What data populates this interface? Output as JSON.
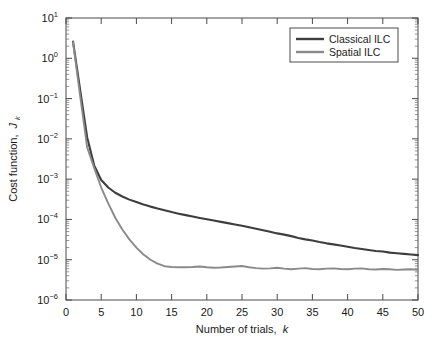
{
  "chart_data": {
    "type": "line",
    "title": "",
    "xlabel": "Number of trials, k",
    "ylabel": "Cost function, J_k",
    "xlabel_text": "Number of trials,",
    "xlabel_italic": "k",
    "ylabel_text": "Cost function,",
    "ylabel_italic": "J",
    "ylabel_sub": "k",
    "xlim": [
      0,
      50
    ],
    "ylim": [
      1e-06,
      10
    ],
    "yscale": "log",
    "xscale": "linear",
    "grid": false,
    "legend_position": "top-right",
    "xticks": [
      0,
      5,
      10,
      15,
      20,
      25,
      30,
      35,
      40,
      45,
      50
    ],
    "xticklabels": [
      "0",
      "5",
      "10",
      "15",
      "20",
      "25",
      "30",
      "35",
      "40",
      "45",
      "50"
    ],
    "yticks": [
      1e-06,
      1e-05,
      0.0001,
      0.001,
      0.01,
      0.1,
      1,
      10
    ],
    "yticklabels": [
      "10−6",
      "10−5",
      "10−4",
      "10−3",
      "10−2",
      "10−1",
      "10⁰",
      "10¹"
    ],
    "ytick_mantissa": "10",
    "ytick_exponents": [
      "-6",
      "-5",
      "-4",
      "-3",
      "-2",
      "-1",
      "0",
      "1"
    ],
    "colors": {
      "classical": "#3d3d3d",
      "spatial": "#8a8a8a",
      "axis": "#4a4a4a",
      "text": "#1a1a1a",
      "background": "#ffffff"
    },
    "x": [
      1,
      2,
      3,
      4,
      5,
      6,
      7,
      8,
      9,
      10,
      11,
      12,
      13,
      14,
      15,
      16,
      17,
      18,
      19,
      20,
      21,
      22,
      23,
      24,
      25,
      26,
      27,
      28,
      29,
      30,
      31,
      32,
      33,
      34,
      35,
      36,
      37,
      38,
      39,
      40,
      41,
      42,
      43,
      44,
      45,
      46,
      47,
      48,
      49,
      50
    ],
    "series": [
      {
        "name": "Classical ILC",
        "color": "#3d3d3d",
        "width": 2.1,
        "values": [
          2.6,
          0.17,
          0.011,
          0.0022,
          0.00095,
          0.00062,
          0.00046,
          0.00037,
          0.00031,
          0.00027,
          0.000235,
          0.000208,
          0.000186,
          0.000168,
          0.000152,
          0.000139,
          0.000128,
          0.000118,
          0.000109,
          0.000101,
          9.4e-05,
          8.7e-05,
          8.1e-05,
          7.5e-05,
          6.95e-05,
          6.4e-05,
          5.9e-05,
          5.4e-05,
          4.95e-05,
          4.5e-05,
          4.2e-05,
          3.85e-05,
          3.45e-05,
          3.2e-05,
          3e-05,
          2.75e-05,
          2.55e-05,
          2.4e-05,
          2.25e-05,
          2.1e-05,
          1.95e-05,
          1.85e-05,
          1.75e-05,
          1.65e-05,
          1.6e-05,
          1.5e-05,
          1.45e-05,
          1.4e-05,
          1.35e-05,
          1.3e-05
        ]
      },
      {
        "name": "Spatial ILC",
        "color": "#8a8a8a",
        "width": 1.9,
        "values": [
          2.5,
          0.12,
          0.0062,
          0.0019,
          0.00062,
          0.00025,
          0.00011,
          5.6e-05,
          3.2e-05,
          2e-05,
          1.35e-05,
          1e-05,
          8e-06,
          6.9e-06,
          6.6e-06,
          6.5e-06,
          6.5e-06,
          6.6e-06,
          6.8e-06,
          6.5e-06,
          6.3e-06,
          6.4e-06,
          6.6e-06,
          6.8e-06,
          7e-06,
          6.5e-06,
          6.2e-06,
          6e-06,
          6.1e-06,
          6.3e-06,
          6e-06,
          5.8e-06,
          6e-06,
          6.2e-06,
          5.9e-06,
          5.8e-06,
          6e-06,
          6.1e-06,
          5.9e-06,
          5.8e-06,
          6e-06,
          6.1e-06,
          5.8e-06,
          5.7e-06,
          5.9e-06,
          5.8e-06,
          5.6e-06,
          5.7e-06,
          5.8e-06,
          5.6e-06
        ]
      }
    ],
    "legend": [
      {
        "label": "Classical ILC",
        "color": "#3d3d3d"
      },
      {
        "label": "Spatial ILC",
        "color": "#8a8a8a"
      }
    ]
  }
}
